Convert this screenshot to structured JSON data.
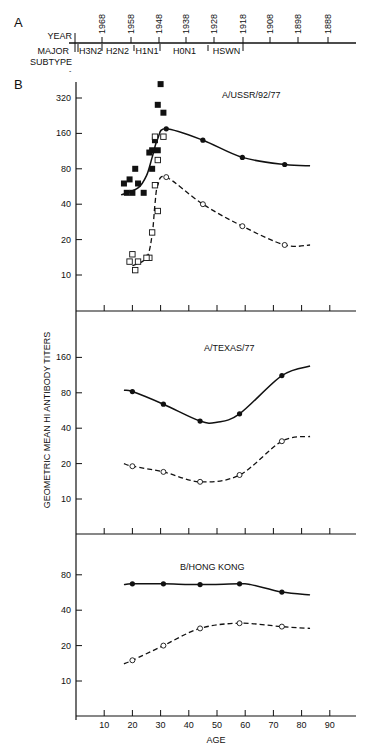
{
  "panel_a": {
    "letter": "A",
    "year_label": "YEAR",
    "subtype_label_1": "MAJOR",
    "subtype_label_2": "SUBTYPE",
    "years": [
      "1968",
      "1958",
      "1948",
      "1938",
      "1928",
      "1918",
      "1908",
      "1898",
      "1888"
    ],
    "subtypes": [
      "H3N2",
      "H2N2",
      "H1N1",
      "H0N1",
      "HSWN"
    ]
  },
  "panel_b": {
    "letter": "B",
    "ylabel": "GEOMETRIC MEAN HI ANTIBODY TITERS",
    "xlabel": "AGE",
    "x_ticks": [
      "10",
      "20",
      "30",
      "40",
      "50",
      "60",
      "70",
      "80",
      "90"
    ]
  },
  "chart_data": [
    {
      "type": "scatter",
      "title": "A/USSR/92/77",
      "xlabel": "AGE",
      "ylabel": "GEOMETRIC MEAN HI ANTIBODY TITERS",
      "yscale": "log2",
      "y_ticks": [
        320,
        160,
        80,
        40,
        20,
        10
      ],
      "xlim": [
        0,
        100
      ],
      "series": [
        {
          "name": "filled circles (solid curve)",
          "marker": "filled-circle",
          "line": "solid",
          "x": [
            32,
            45,
            59,
            74
          ],
          "values": [
            175,
            140,
            100,
            87
          ]
        },
        {
          "name": "open circles (dashed curve)",
          "marker": "open-circle",
          "line": "dashed",
          "x": [
            32,
            45,
            59,
            74
          ],
          "values": [
            68,
            40,
            26,
            18
          ]
        },
        {
          "name": "filled squares (individual)",
          "marker": "filled-square",
          "x": [
            30,
            29,
            31,
            28,
            27,
            29,
            26,
            21,
            27,
            19,
            17,
            22,
            24,
            20,
            18
          ],
          "values": [
            420,
            280,
            240,
            140,
            115,
            115,
            110,
            80,
            80,
            65,
            60,
            60,
            50,
            50,
            50
          ]
        },
        {
          "name": "open squares (individual)",
          "marker": "open-square",
          "x": [
            28,
            31,
            29,
            28,
            29,
            27,
            26,
            25,
            20,
            19,
            21,
            22
          ],
          "values": [
            150,
            150,
            95,
            58,
            35,
            23,
            14,
            14,
            15,
            13,
            11,
            13
          ]
        }
      ],
      "curves": {
        "solid": {
          "x": [
            16,
            22,
            25,
            27,
            29,
            32,
            45,
            59,
            74,
            83
          ],
          "values": [
            48,
            55,
            70,
            100,
            145,
            175,
            140,
            100,
            87,
            85
          ]
        },
        "dashed": {
          "x": [
            20,
            25,
            27,
            28,
            29,
            32,
            45,
            59,
            74,
            83
          ],
          "values": [
            12,
            14,
            22,
            40,
            58,
            68,
            40,
            26,
            18,
            18
          ]
        }
      }
    },
    {
      "type": "line",
      "title": "A/TEXAS/77",
      "xlabel": "AGE",
      "yscale": "log2",
      "y_ticks": [
        160,
        80,
        40,
        20,
        10
      ],
      "series": [
        {
          "name": "filled circles (solid)",
          "marker": "filled-circle",
          "line": "solid",
          "x": [
            20,
            31,
            44,
            58,
            73
          ],
          "values": [
            82,
            64,
            46,
            53,
            112
          ]
        },
        {
          "name": "open circles (dashed)",
          "marker": "open-circle",
          "line": "dashed",
          "x": [
            20,
            31,
            44,
            58,
            73
          ],
          "values": [
            19,
            17,
            14,
            16,
            31
          ]
        }
      ],
      "curves": {
        "solid": {
          "x": [
            17,
            20,
            31,
            44,
            50,
            58,
            73,
            83
          ],
          "values": [
            84,
            82,
            64,
            46,
            45,
            53,
            112,
            135
          ]
        },
        "dashed": {
          "x": [
            17,
            20,
            31,
            44,
            58,
            73,
            83
          ],
          "values": [
            20,
            19,
            17,
            14,
            16,
            31,
            34
          ]
        }
      }
    },
    {
      "type": "line",
      "title": "B/HONG KONG",
      "xlabel": "AGE",
      "yscale": "log2",
      "y_ticks": [
        80,
        40,
        20,
        10
      ],
      "x_ticks": [
        10,
        20,
        30,
        40,
        50,
        60,
        70,
        80,
        90
      ],
      "series": [
        {
          "name": "filled circles (solid)",
          "marker": "filled-circle",
          "line": "solid",
          "x": [
            20,
            31,
            44,
            58,
            73
          ],
          "values": [
            67,
            67,
            66,
            67,
            57
          ]
        },
        {
          "name": "open circles (dashed)",
          "marker": "open-circle",
          "line": "dashed",
          "x": [
            20,
            31,
            44,
            58,
            73
          ],
          "values": [
            15,
            20,
            28,
            31,
            29
          ]
        }
      ],
      "curves": {
        "solid": {
          "x": [
            17,
            20,
            31,
            44,
            58,
            62,
            73,
            83
          ],
          "values": [
            66,
            67,
            67,
            66,
            67,
            66,
            57,
            54
          ]
        },
        "dashed": {
          "x": [
            17,
            20,
            31,
            44,
            58,
            73,
            83
          ],
          "values": [
            14,
            15,
            20,
            28,
            31,
            29,
            28
          ]
        }
      }
    }
  ]
}
